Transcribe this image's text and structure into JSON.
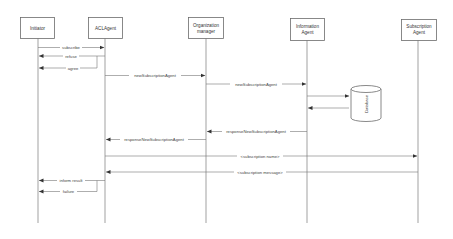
{
  "diagram": {
    "type": "sequence",
    "participants": [
      {
        "id": "initiator",
        "label_lines": [
          "Initiator"
        ],
        "x": 38
      },
      {
        "id": "aclagent",
        "label_lines": [
          "ACLAgent"
        ],
        "x": 105
      },
      {
        "id": "orgmanager",
        "label_lines": [
          "Organization",
          "manager"
        ],
        "x": 206
      },
      {
        "id": "infoagent",
        "label_lines": [
          "Information",
          "Agent"
        ],
        "x": 307
      },
      {
        "id": "subagent",
        "label_lines": [
          "Subscription",
          "Agent"
        ],
        "x": 418
      }
    ],
    "database": {
      "label": "Database"
    },
    "messages": [
      {
        "label": "subscribe",
        "from": "initiator",
        "to": "aclagent"
      },
      {
        "label": "refuse",
        "from": "aclagent",
        "to": "initiator"
      },
      {
        "label": "agree",
        "from": "aclagent",
        "to": "initiator"
      },
      {
        "label": "newSubscriptionAgent",
        "from": "aclagent",
        "to": "orgmanager"
      },
      {
        "label": "newSubscriptionAgent",
        "from": "orgmanager",
        "to": "infoagent"
      },
      {
        "label": "",
        "from": "infoagent",
        "to": "database"
      },
      {
        "label": "",
        "from": "database",
        "to": "infoagent"
      },
      {
        "label": "responseNewSubscriptionAgent",
        "from": "infoagent",
        "to": "orgmanager"
      },
      {
        "label": "responseNewSubscriptionAgent",
        "from": "orgmanager",
        "to": "aclagent"
      },
      {
        "label": "<subscription name>",
        "from": "aclagent",
        "to": "subagent"
      },
      {
        "label": "<subscription message>",
        "from": "subagent",
        "to": "aclagent"
      },
      {
        "label": "inform result",
        "from": "aclagent",
        "to": "initiator"
      },
      {
        "label": "failure",
        "from": "aclagent",
        "to": "initiator"
      }
    ]
  },
  "labels": {
    "p0_l0": "Initiator",
    "p1_l0": "ACLAgent",
    "p2_l0": "Organization",
    "p2_l1": "manager",
    "p3_l0": "Information",
    "p3_l1": "Agent",
    "p4_l0": "Subscription",
    "p4_l1": "Agent",
    "db": "Database",
    "m0": "subscribe",
    "m1": "refuse",
    "m2": "agree",
    "m3": "newSubscriptionAgent",
    "m4": "newSubscriptionAgent",
    "m7": "responseNewSubscriptionAgent",
    "m8": "responseNewSubscriptionAgent",
    "m9": "<subscription name>",
    "m10": "<subscription message>",
    "m11": "inform result",
    "m12": "failure"
  },
  "colors": {
    "line": "#777777",
    "box_stroke": "#6b6b6b",
    "text": "#333333",
    "background": "#ffffff"
  }
}
